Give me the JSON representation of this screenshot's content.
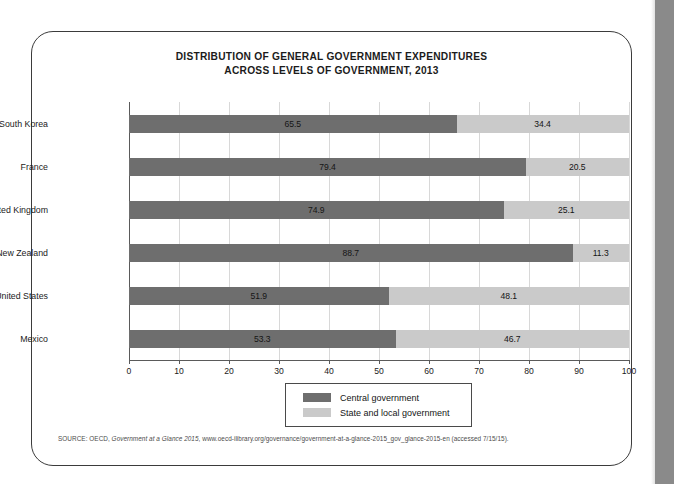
{
  "chart_data": {
    "type": "bar",
    "orientation": "horizontal",
    "stacked": true,
    "title_line1": "DISTRIBUTION OF GENERAL GOVERNMENT EXPENDITURES",
    "title_line2": "ACROSS LEVELS OF GOVERNMENT, 2013",
    "title": "DISTRIBUTION OF GENERAL GOVERNMENT EXPENDITURES ACROSS LEVELS OF GOVERNMENT, 2013",
    "xlabel": "",
    "ylabel": "",
    "xlim": [
      0,
      100
    ],
    "xticks": [
      0,
      10,
      20,
      30,
      40,
      50,
      60,
      70,
      80,
      90,
      100
    ],
    "xtick_labels": [
      "0",
      "10",
      "20",
      "30",
      "40",
      "50",
      "60",
      "70",
      "80",
      "90",
      "100"
    ],
    "grid": true,
    "legend_position": "bottom-center",
    "categories": [
      "South Korea",
      "France",
      "United Kingdom",
      "New Zealand",
      "United States",
      "Mexico"
    ],
    "series": [
      {
        "name": "Central government",
        "color": "#6e6e6e",
        "values": [
          65.5,
          79.4,
          74.9,
          88.7,
          51.9,
          53.3
        ],
        "labels": [
          "65.5",
          "79.4",
          "74.9",
          "88.7",
          "51.9",
          "53.3"
        ]
      },
      {
        "name": "State and local government",
        "color": "#cacaca",
        "values": [
          34.4,
          20.5,
          25.1,
          11.3,
          48.1,
          46.7
        ],
        "labels": [
          "34.4",
          "20.5",
          "25.1",
          "11.3",
          "48.1",
          "46.7"
        ]
      }
    ]
  },
  "legend": {
    "items": [
      {
        "label": "Central government",
        "color": "#6e6e6e"
      },
      {
        "label": "State and local government",
        "color": "#cacaca"
      }
    ]
  },
  "source": {
    "prefix": "SOURCE: OECD, ",
    "italic": "Government at a Glance 2015",
    "suffix": ", www.oecd-ilibrary.org/governance/government-at-a-glance-2015_gov_glance-2015-en (accessed 7/15/15)."
  },
  "colors": {
    "central": "#6e6e6e",
    "state_local": "#cacaca",
    "axis": "#5a5a5a",
    "grid": "#d8d8d8",
    "card_border": "#3b3b3b",
    "page_edge": "#8a8a8a"
  }
}
